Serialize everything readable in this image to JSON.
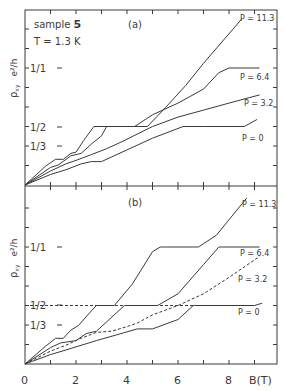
{
  "figure": {
    "sample_label": "sample",
    "sample_number": "5",
    "temperature": "T = 1.3 K",
    "panel_a_label": "(a)",
    "panel_b_label": "(b)",
    "y_axis_label": "ρ",
    "y_axis_sub": "xy",
    "y_axis_units": "e²/h",
    "x_axis_label": "B(T)",
    "y_ticks": [
      "1/1",
      "1/2",
      "1/3"
    ],
    "x_ticks": [
      "0",
      "2",
      "4",
      "6",
      "8"
    ]
  },
  "chart_data": [
    {
      "type": "line",
      "title": "(a) sample 5, T = 1.3 K",
      "xlabel": "B (T)",
      "ylabel": "ρxy (h/e²)",
      "xlim": [
        0,
        9.9
      ],
      "ylim": [
        0,
        1.5
      ],
      "y_ticks_labeled": {
        "1/1": 1.0,
        "1/2": 0.5,
        "1/3": 0.333
      },
      "series": [
        {
          "name": "P = 11.3",
          "style": "solid",
          "x": [
            0,
            0.8,
            1.2,
            1.5,
            1.8,
            2.0,
            2.3,
            2.7,
            4.0,
            4.8,
            5.5,
            6.3,
            7.0,
            8.5
          ],
          "y": [
            0,
            0.16,
            0.22,
            0.22,
            0.27,
            0.28,
            0.38,
            0.5,
            0.5,
            0.5,
            0.66,
            0.85,
            1.04,
            1.42
          ]
        },
        {
          "name": "P = 6.4",
          "style": "solid",
          "x": [
            0,
            1.0,
            1.3,
            1.8,
            2.2,
            2.6,
            3.0,
            3.2,
            4.3,
            5.0,
            6.0,
            7.0,
            7.6,
            8.0,
            9.2
          ],
          "y": [
            0,
            0.15,
            0.17,
            0.25,
            0.27,
            0.35,
            0.42,
            0.5,
            0.5,
            0.6,
            0.7,
            0.82,
            0.96,
            1.0,
            1.0
          ]
        },
        {
          "name": "P = 3.2",
          "style": "solid",
          "x": [
            0,
            1.0,
            1.6,
            2.0,
            2.6,
            3.2,
            3.8,
            5.0,
            6.0,
            7.0,
            8.0,
            9.2
          ],
          "y": [
            0,
            0.12,
            0.18,
            0.21,
            0.26,
            0.31,
            0.37,
            0.5,
            0.58,
            0.64,
            0.7,
            0.77
          ]
        },
        {
          "name": "P = 0",
          "style": "solid",
          "x": [
            0,
            1.0,
            1.6,
            2.2,
            2.6,
            3.0,
            3.4,
            4.0,
            5.0,
            6.2,
            7.0,
            8.6,
            9.1
          ],
          "y": [
            0,
            0.09,
            0.13,
            0.18,
            0.2,
            0.2,
            0.24,
            0.3,
            0.4,
            0.5,
            0.5,
            0.5,
            0.56
          ]
        }
      ]
    },
    {
      "type": "line",
      "title": "(b)",
      "xlabel": "B (T)",
      "ylabel": "ρxy (h/e²)",
      "xlim": [
        0,
        9.9
      ],
      "ylim": [
        0,
        1.5
      ],
      "y_ticks_labeled": {
        "1/1": 1.0,
        "1/2": 0.5,
        "1/3": 0.333
      },
      "series": [
        {
          "name": "P = 11.3",
          "style": "solid",
          "x": [
            0,
            0.8,
            1.2,
            1.5,
            1.8,
            2.1,
            2.5,
            2.8,
            3.5,
            4.2,
            5.0,
            5.3,
            6.8,
            7.5,
            8.7
          ],
          "y": [
            0,
            0.15,
            0.22,
            0.22,
            0.29,
            0.33,
            0.43,
            0.5,
            0.5,
            0.68,
            0.96,
            1.0,
            1.0,
            1.1,
            1.42
          ]
        },
        {
          "name": "P = 6.4",
          "style": "solid",
          "x": [
            0,
            1.0,
            1.4,
            2.0,
            2.4,
            2.8,
            3.2,
            3.6,
            3.9,
            5.2,
            6.0,
            7.0,
            7.6,
            9.2
          ],
          "y": [
            0,
            0.14,
            0.18,
            0.2,
            0.26,
            0.28,
            0.36,
            0.44,
            0.5,
            0.5,
            0.6,
            0.85,
            1.0,
            1.0
          ]
        },
        {
          "name": "P = 3.2",
          "style": "dashed",
          "x": [
            0,
            1.0,
            1.6,
            2.2,
            2.8,
            3.4,
            4.0,
            4.4,
            5.0,
            6.0,
            7.0,
            8.0,
            9.2
          ],
          "y": [
            0,
            0.11,
            0.16,
            0.22,
            0.27,
            0.28,
            0.32,
            0.35,
            0.42,
            0.5,
            0.6,
            0.74,
            0.92
          ]
        },
        {
          "name": "P = 0",
          "style": "solid",
          "x": [
            0,
            1.0,
            1.6,
            2.2,
            2.8,
            3.6,
            4.4,
            5.0,
            6.0,
            6.6,
            8.0,
            9.0,
            9.3
          ],
          "y": [
            0,
            0.08,
            0.12,
            0.16,
            0.2,
            0.25,
            0.3,
            0.3,
            0.38,
            0.5,
            0.5,
            0.5,
            0.52
          ]
        },
        {
          "name": "P = 0 reference (ρ = 1/2 plateau)",
          "style": "dashed",
          "x": [
            0.0,
            6.6
          ],
          "y": [
            0.5,
            0.5
          ],
          "note": "dashed horizontal segment at 1/2 continuing left of solid plateau, from ~B=3.6"
        }
      ]
    }
  ],
  "labels": {
    "p113": "P = 11.3",
    "p64": "P = 6.4",
    "p32": "P = 3.2",
    "p0": "P = 0"
  },
  "colors": {
    "line": "#3a3a3a",
    "background": "#ffffff"
  }
}
